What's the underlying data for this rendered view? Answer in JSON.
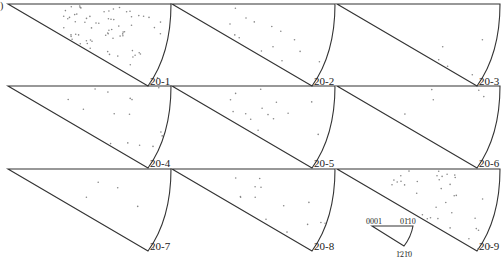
{
  "figure": {
    "panel_fragment": ")",
    "panels": [
      {
        "label": "20-1",
        "col": 0,
        "row": 0,
        "density": "high"
      },
      {
        "label": "20-2",
        "col": 1,
        "row": 0,
        "density": "low"
      },
      {
        "label": "20-3",
        "col": 2,
        "row": 0,
        "density": "very-low"
      },
      {
        "label": "20-4",
        "col": 0,
        "row": 1,
        "density": "low"
      },
      {
        "label": "20-5",
        "col": 1,
        "row": 1,
        "density": "low"
      },
      {
        "label": "20-6",
        "col": 2,
        "row": 1,
        "density": "very-low"
      },
      {
        "label": "20-7",
        "col": 0,
        "row": 2,
        "density": "very-low"
      },
      {
        "label": "20-8",
        "col": 1,
        "row": 2,
        "density": "low"
      },
      {
        "label": "20-9",
        "col": 2,
        "row": 2,
        "density": "medium"
      }
    ],
    "legend": {
      "vertex_0001": "0001",
      "vertex_01-10": "01̄10",
      "vertex_-12-10": "1̄21̄0"
    }
  }
}
